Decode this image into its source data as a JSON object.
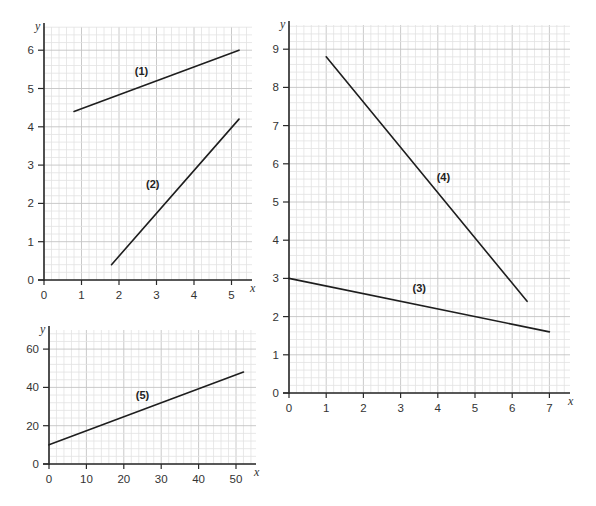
{
  "chart_data": [
    {
      "id": "graph-top-left",
      "type": "line",
      "title": "",
      "xlabel": "x",
      "ylabel": "y",
      "xlim": [
        0,
        5.5
      ],
      "ylim": [
        0,
        6.6
      ],
      "xticks": [
        0,
        1,
        2,
        3,
        4,
        5
      ],
      "yticks": [
        0,
        1,
        2,
        3,
        4,
        5,
        6
      ],
      "grid": true,
      "minor_divisions": 5,
      "series": [
        {
          "name": "(1)",
          "x": [
            0.8,
            5.2
          ],
          "y": [
            4.4,
            6.0
          ],
          "label_pos": [
            2.6,
            5.35
          ]
        },
        {
          "name": "(2)",
          "x": [
            1.8,
            5.2
          ],
          "y": [
            0.4,
            4.2
          ],
          "label_pos": [
            2.9,
            2.4
          ]
        }
      ]
    },
    {
      "id": "graph-right",
      "type": "line",
      "title": "",
      "xlabel": "x",
      "ylabel": "y",
      "xlim": [
        0,
        7.6
      ],
      "ylim": [
        0,
        9.6
      ],
      "xticks": [
        0,
        1,
        2,
        3,
        4,
        5,
        6,
        7
      ],
      "yticks": [
        0,
        1,
        2,
        3,
        4,
        5,
        6,
        7,
        8,
        9
      ],
      "grid": true,
      "minor_divisions": 5,
      "series": [
        {
          "name": "(3)",
          "x": [
            0,
            7
          ],
          "y": [
            3.0,
            1.6
          ],
          "label_pos": [
            3.5,
            2.65
          ]
        },
        {
          "name": "(4)",
          "x": [
            1,
            6.4
          ],
          "y": [
            8.8,
            2.4
          ],
          "label_pos": [
            4.15,
            5.55
          ]
        }
      ]
    },
    {
      "id": "graph-bottom-left",
      "type": "line",
      "title": "",
      "xlabel": "x",
      "ylabel": "y",
      "xlim": [
        0,
        55
      ],
      "ylim": [
        0,
        70
      ],
      "xticks": [
        0,
        10,
        20,
        30,
        40,
        50
      ],
      "yticks": [
        0,
        20,
        40,
        60
      ],
      "grid": true,
      "minor_divisions": 5,
      "series": [
        {
          "name": "(5)",
          "x": [
            0,
            52
          ],
          "y": [
            10,
            48
          ],
          "label_pos": [
            25,
            34
          ]
        }
      ]
    }
  ],
  "layout": [
    {
      "ox": 44,
      "oy": 280,
      "sx": 37.5,
      "sy": 38.3,
      "x_right": 252,
      "y_top": 27
    },
    {
      "ox": 289,
      "oy": 393,
      "sx": 37.2,
      "sy": 38.2,
      "x_right": 570,
      "y_top": 25
    },
    {
      "ox": 49,
      "oy": 464,
      "sx": 3.74,
      "sy": 1.915,
      "x_right": 256,
      "y_top": 330
    }
  ]
}
